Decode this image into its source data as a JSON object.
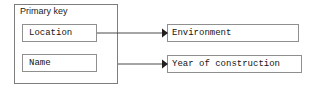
{
  "diagram": {
    "type": "entity-attribute-mapping",
    "primary_key_group": {
      "title": "Primary key",
      "fields": [
        {
          "label": "Location"
        },
        {
          "label": "Name"
        }
      ]
    },
    "targets": [
      {
        "label": "Environment"
      },
      {
        "label": "Year of construction"
      }
    ],
    "connectors": [
      {
        "from": "Location",
        "to": "Environment",
        "arrow": "arrowhead-right"
      },
      {
        "from": "Name",
        "to": "Year of construction",
        "arrow": "arrowhead-right"
      }
    ],
    "colors": {
      "border": "#8a8a8a",
      "text": "#141414",
      "line": "#4a4a4a",
      "background": "#ffffff"
    }
  }
}
